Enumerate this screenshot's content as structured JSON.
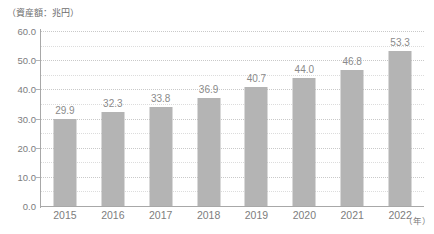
{
  "chart_data": {
    "type": "bar",
    "title": "",
    "subtitle": "",
    "unit_caption": "（資産額：兆円）",
    "xlabel": "（年）",
    "ylabel": "",
    "categories": [
      "2015",
      "2016",
      "2017",
      "2018",
      "2019",
      "2020",
      "2021",
      "2022"
    ],
    "values": [
      29.9,
      32.3,
      33.8,
      36.9,
      40.7,
      44.0,
      46.8,
      53.3
    ],
    "value_labels": [
      "29.9",
      "32.3",
      "33.8",
      "36.9",
      "40.7",
      "44.0",
      "46.8",
      "53.3"
    ],
    "ylim": [
      0.0,
      60.0
    ],
    "ytick_values": [
      0.0,
      10.0,
      20.0,
      30.0,
      40.0,
      50.0,
      60.0
    ],
    "ytick_labels": [
      "0.0",
      "10.0",
      "20.0",
      "30.0",
      "40.0",
      "50.0",
      "60.0"
    ],
    "minor_tick_values": [
      5.0,
      15.0,
      25.0,
      35.0,
      45.0,
      55.0
    ],
    "grid": "horizontal-dotted",
    "legend": "none",
    "series": [
      {
        "name": "資産額",
        "values": [
          29.9,
          32.3,
          33.8,
          36.9,
          40.7,
          44.0,
          46.8,
          53.3
        ]
      }
    ]
  },
  "colors": {
    "bar": "#b4b4b4",
    "gridline_major": "#c9c9c9",
    "gridline_minor": "#dcdcdc",
    "axis": "#a8a8a8",
    "text": "#7d7d7d",
    "value_text": "#8a8a8a",
    "caption_text": "#6e6e6e",
    "background": "#ffffff"
  }
}
